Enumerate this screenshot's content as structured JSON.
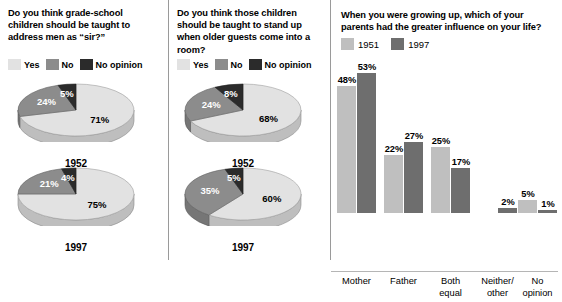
{
  "chart_data": [
    {
      "type": "pie",
      "title": "Do you think grade-school children should be taught to address men as “sir?”",
      "legend": [
        "Yes",
        "No",
        "No opinion"
      ],
      "legend_position": "top",
      "series": [
        {
          "name": "1952",
          "categories": [
            "Yes",
            "No",
            "No opinion"
          ],
          "values": [
            71,
            24,
            5
          ]
        },
        {
          "name": "1997",
          "categories": [
            "Yes",
            "No",
            "No opinion"
          ],
          "values": [
            75,
            21,
            4
          ]
        }
      ]
    },
    {
      "type": "pie",
      "title": "Do you think those children should be taught to stand up when older guests come into a room?",
      "legend": [
        "Yes",
        "No",
        "No opinion"
      ],
      "legend_position": "top",
      "series": [
        {
          "name": "1952",
          "categories": [
            "Yes",
            "No",
            "No opinion"
          ],
          "values": [
            68,
            24,
            8
          ]
        },
        {
          "name": "1997",
          "categories": [
            "Yes",
            "No",
            "No opinion"
          ],
          "values": [
            60,
            35,
            5
          ]
        }
      ]
    },
    {
      "type": "bar",
      "title": "When you were growing up, which of your parents had the greater influence on your life?",
      "categories": [
        "Mother",
        "Father",
        "Both equal",
        "Neither/ other",
        "No opinion"
      ],
      "series": [
        {
          "name": "1951",
          "values": [
            48,
            22,
            25,
            null,
            5
          ]
        },
        {
          "name": "1997",
          "values": [
            53,
            27,
            17,
            2,
            1
          ]
        }
      ],
      "xlabel": "",
      "ylabel": "",
      "ylim": [
        0,
        60
      ],
      "grid": false,
      "legend_position": "top-left"
    }
  ],
  "colors": {
    "yes": "#e2e2e2",
    "no": "#8c8c8c",
    "no_opinion": "#2b2b2b",
    "bar_1951": "#bfbfbf",
    "bar_1997": "#6e6e6e",
    "divider": "#9a9a9a",
    "axis": "#b5b5b5",
    "background": "#ffffff",
    "text": "#000000"
  },
  "panel_a": {
    "question": "Do you think grade-school children should be taught to address men as “sir?”",
    "legend": [
      {
        "label": "Yes",
        "swatch": "yes"
      },
      {
        "label": "No",
        "swatch": "no"
      },
      {
        "label": "No opinion",
        "swatch": "no_opinion"
      }
    ],
    "pies": [
      {
        "year": "1952",
        "slices": [
          {
            "label": "71%",
            "value": 71,
            "swatch": "yes"
          },
          {
            "label": "24%",
            "value": 24,
            "swatch": "no"
          },
          {
            "label": "5%",
            "value": 5,
            "swatch": "no_opinion"
          }
        ]
      },
      {
        "year": "1997",
        "slices": [
          {
            "label": "75%",
            "value": 75,
            "swatch": "yes"
          },
          {
            "label": "21%",
            "value": 21,
            "swatch": "no"
          },
          {
            "label": "4%",
            "value": 4,
            "swatch": "no_opinion"
          }
        ]
      }
    ]
  },
  "panel_b": {
    "question": "Do you think those children should be taught to stand up when older guests come into a room?",
    "legend": [
      {
        "label": "Yes",
        "swatch": "yes"
      },
      {
        "label": "No",
        "swatch": "no"
      },
      {
        "label": "No opinion",
        "swatch": "no_opinion"
      }
    ],
    "pies": [
      {
        "year": "1952",
        "slices": [
          {
            "label": "68%",
            "value": 68,
            "swatch": "yes"
          },
          {
            "label": "24%",
            "value": 24,
            "swatch": "no"
          },
          {
            "label": "8%",
            "value": 8,
            "swatch": "no_opinion"
          }
        ]
      },
      {
        "year": "1997",
        "slices": [
          {
            "label": "60%",
            "value": 60,
            "swatch": "yes"
          },
          {
            "label": "35%",
            "value": 35,
            "swatch": "no"
          },
          {
            "label": "5%",
            "value": 5,
            "swatch": "no_opinion"
          }
        ]
      }
    ]
  },
  "panel_c": {
    "question": "When you were growing up, which of your parents had the greater influence on your life?",
    "legend": [
      {
        "label": "1951",
        "swatch": "bar_1951"
      },
      {
        "label": "1997",
        "swatch": "bar_1997"
      }
    ],
    "groups": [
      {
        "label_line1": "Mother",
        "label_line2": "",
        "v1951": 48,
        "v1997": 53,
        "t1951": "48%",
        "t1997": "53%"
      },
      {
        "label_line1": "Father",
        "label_line2": "",
        "v1951": 22,
        "v1997": 27,
        "t1951": "22%",
        "t1997": "27%"
      },
      {
        "label_line1": "Both",
        "label_line2": "equal",
        "v1951": 25,
        "v1997": 17,
        "t1951": "25%",
        "t1997": "17%"
      },
      {
        "label_line1": "Neither/",
        "label_line2": "other",
        "v1951": null,
        "v1997": 2,
        "t1951": "",
        "t1997": "2%"
      },
      {
        "label_line1": "No",
        "label_line2": "opinion",
        "v1951": 5,
        "v1997": 1,
        "t1951": "5%",
        "t1997": "1%"
      }
    ]
  }
}
